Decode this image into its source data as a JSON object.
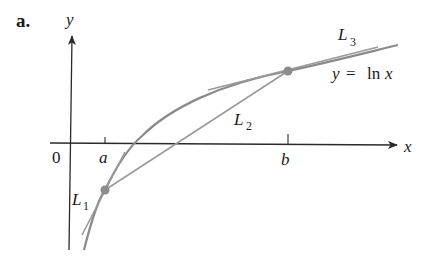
{
  "figure": {
    "panel_label": "a.",
    "axes": {
      "x_label": "x",
      "y_label": "y",
      "origin_label": "0",
      "ticks": [
        {
          "label": "a",
          "px": 105
        },
        {
          "label": "b",
          "px": 288
        }
      ]
    },
    "curve": {
      "equation_lhs": "y",
      "equation_eq": "=",
      "equation_rhs_fn": "ln",
      "equation_rhs_var": "x"
    },
    "lines": [
      {
        "id": "L1",
        "label_main": "L",
        "label_sub": "1",
        "kind": "tangent at a"
      },
      {
        "id": "L2",
        "label_main": "L",
        "label_sub": "2",
        "kind": "secant from a to b"
      },
      {
        "id": "L3",
        "label_main": "L",
        "label_sub": "3",
        "kind": "tangent at b"
      }
    ],
    "points": [
      {
        "name": "A",
        "at": "a"
      },
      {
        "name": "B",
        "at": "b"
      }
    ],
    "colors": {
      "axis": "#2a2a2a",
      "curve": "#8a8a8a",
      "lines": "#9a9a9a",
      "points": "#8c8c8c",
      "text": "#1a1a1a"
    }
  }
}
